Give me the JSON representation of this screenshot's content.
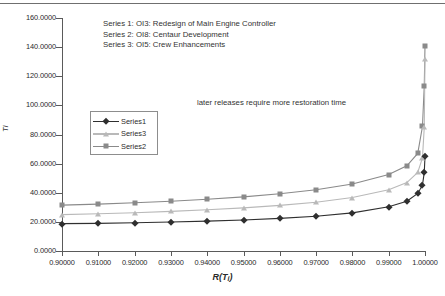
{
  "chart_data": {
    "type": "line",
    "title": "",
    "xlabel": "R(Ti)",
    "ylabel": "Ti",
    "xlim": [
      0.9,
      1.0
    ],
    "ylim": [
      0.0,
      160.0
    ],
    "grid": false,
    "legend_position": "inside-left",
    "annotations": [
      "Series 1: OI3: Redesign of Main Engine Controller",
      "Series 2: OI8: Centaur Development",
      "Series 3: OI5: Crew Enhancements",
      "later releases require more restoration time"
    ],
    "xticklabels": [
      "0.90000",
      "0.91000",
      "0.92000",
      "0.93000",
      "0.94000",
      "0.95000",
      "0.96000",
      "0.97000",
      "0.98000",
      "0.99000",
      "1.00000"
    ],
    "yticklabels": [
      "0.0000",
      "20.0000",
      "40.0000",
      "60.0000",
      "80.0000",
      "100.0000",
      "120.0000",
      "140.0000",
      "160.0000"
    ],
    "xticks": [
      0.9,
      0.91,
      0.92,
      0.93,
      0.94,
      0.95,
      0.96,
      0.97,
      0.98,
      0.99,
      1.0
    ],
    "yticks": [
      0,
      20,
      40,
      60,
      80,
      100,
      120,
      140,
      160
    ],
    "x": [
      0.9,
      0.91,
      0.92,
      0.93,
      0.94,
      0.95,
      0.96,
      0.97,
      0.98,
      0.99,
      0.995,
      0.998,
      0.9993,
      0.9998,
      1.0
    ],
    "series": [
      {
        "name": "Series1",
        "marker": "diamond",
        "color": "#2f2f2f",
        "values": [
          18.8,
          19.0,
          19.4,
          19.9,
          20.5,
          21.3,
          22.4,
          23.9,
          26.2,
          30.4,
          34.2,
          39.5,
          45.2,
          54.0,
          65.0
        ]
      },
      {
        "name": "Series3",
        "marker": "triangle",
        "color": "#b9b9b9",
        "values": [
          25.0,
          25.6,
          26.3,
          27.2,
          28.3,
          29.6,
          31.3,
          33.5,
          36.7,
          42.0,
          47.0,
          54.0,
          64.0,
          85.0,
          132.0
        ]
      },
      {
        "name": "Series2",
        "marker": "square",
        "color": "#8a8a8a",
        "values": [
          31.5,
          32.2,
          33.1,
          34.2,
          35.5,
          37.2,
          39.3,
          42.1,
          46.0,
          52.5,
          58.5,
          67.0,
          85.5,
          113.5,
          141.0
        ]
      }
    ]
  },
  "legend": {
    "entries": [
      {
        "label": "Series1"
      },
      {
        "label": "Series3"
      },
      {
        "label": "Series2"
      }
    ]
  },
  "caption": {
    "line1": "Series 1: OI3: Redesign of Main Engine Controller",
    "line2": "Series 2: OI8: Centaur Development",
    "line3": "Series 3: OI5: Crew Enhancements"
  },
  "note": {
    "text": "later releases require more restoration time"
  },
  "axis_titles": {
    "y": "Ti",
    "x_main": "R(T",
    "x_sub": "i",
    "x_close": ")"
  }
}
